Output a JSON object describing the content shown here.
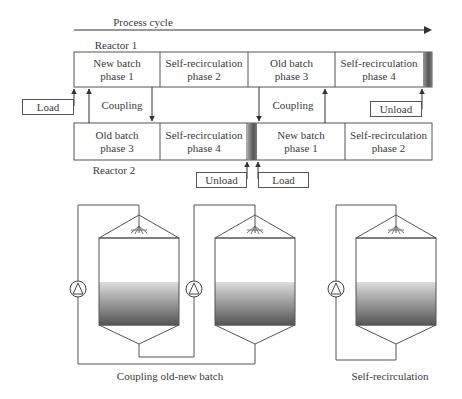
{
  "timeline": {
    "title": "Process cycle",
    "reactor1": {
      "label": "Reactor 1",
      "phases": [
        {
          "line1": "New batch",
          "line2": "phase 1"
        },
        {
          "line1": "Self-recirculation",
          "line2": "phase 2"
        },
        {
          "line1": "Old batch",
          "line2": "phase 3"
        },
        {
          "line1": "Self-recirculation",
          "line2": "phase 4"
        }
      ],
      "load_label": "Load",
      "unload_label": "Unload"
    },
    "reactor2": {
      "label": "Reactor 2",
      "phases": [
        {
          "line1": "Old batch",
          "line2": "phase 3"
        },
        {
          "line1": "Self-recirculation",
          "line2": "phase 4"
        },
        {
          "line1": "New batch",
          "line2": "phase 1"
        },
        {
          "line1": "Self-recirculation",
          "line2": "phase 2"
        }
      ],
      "load_label": "Load",
      "unload_label": "Unload"
    },
    "coupling_labels": [
      "Coupling",
      "Coupling"
    ]
  },
  "schematics": {
    "coupling": {
      "caption": "Coupling old-new batch"
    },
    "self": {
      "caption": "Self-recirculation"
    }
  },
  "colors": {
    "line": "#555555",
    "liquid_top": "#d8d8d8",
    "liquid_bottom": "#5a5a5a",
    "bar_dark": "#6a6a6a"
  }
}
